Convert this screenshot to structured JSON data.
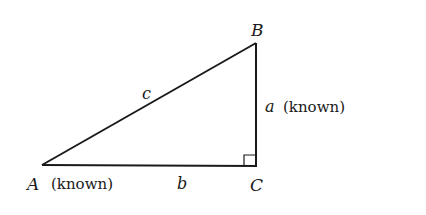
{
  "diagram": {
    "type": "right-triangle",
    "vertices": {
      "A": {
        "label": "A",
        "note": "(known)"
      },
      "B": {
        "label": "B"
      },
      "C": {
        "label": "C",
        "right_angle": true
      }
    },
    "sides": {
      "a": {
        "label": "a",
        "note": "(known)",
        "between": [
          "B",
          "C"
        ]
      },
      "b": {
        "label": "b",
        "between": [
          "A",
          "C"
        ]
      },
      "c": {
        "label": "c",
        "between": [
          "A",
          "B"
        ]
      }
    }
  }
}
